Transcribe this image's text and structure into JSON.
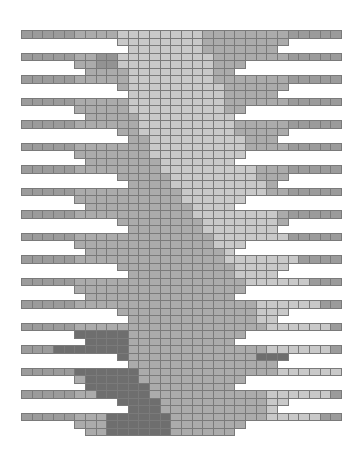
{
  "diagram": {
    "origin": {
      "x": 21,
      "y": 30
    },
    "cell": {
      "w": 10.67,
      "h": 7.5
    },
    "columns": 30,
    "palette": {
      "L": "#c9c9c9",
      "M": "#ababab",
      "D": "#939393",
      "X": "#6e6e6e",
      "E": "#9b9b9b",
      "grid": "#7a7a7a"
    },
    "row_pattern": [
      {
        "type": "full",
        "from": 0,
        "to": 29
      },
      {
        "type": "wideA",
        "from": 9,
        "to": 24
      },
      {
        "type": "narrowA",
        "from": 10,
        "to": 23
      },
      {
        "type": "full",
        "from": 0,
        "to": 29
      },
      {
        "type": "wideB",
        "from": 5,
        "to": 20
      },
      {
        "type": "narrowB",
        "from": 6,
        "to": 19
      }
    ],
    "row_count": 54,
    "shading": {
      "light_band": [
        {
          "row": 0,
          "from": 9,
          "to": 16
        },
        {
          "row": 9,
          "from": 10,
          "to": 18
        },
        {
          "row": 18,
          "from": 13,
          "to": 21
        },
        {
          "row": 27,
          "from": 18,
          "to": 24
        },
        {
          "row": 36,
          "from": 22,
          "to": 27
        },
        {
          "row": 45,
          "from": 24,
          "to": 29
        },
        {
          "row": 53,
          "from": 22,
          "to": 26
        }
      ],
      "dark_band": [
        {
          "row": 3,
          "from": 7,
          "to": 8
        },
        {
          "row": 40,
          "from": 0,
          "to": 9
        },
        {
          "row": 44,
          "from": 5,
          "to": 9
        },
        {
          "row": 49,
          "from": 7,
          "to": 12
        },
        {
          "row": 53,
          "from": 8,
          "to": 13
        }
      ],
      "dark_right": [
        {
          "row": 40,
          "from": 25,
          "to": 29
        },
        {
          "row": 43,
          "from": 22,
          "to": 29
        },
        {
          "row": 46,
          "from": 25,
          "to": 29
        }
      ]
    }
  }
}
